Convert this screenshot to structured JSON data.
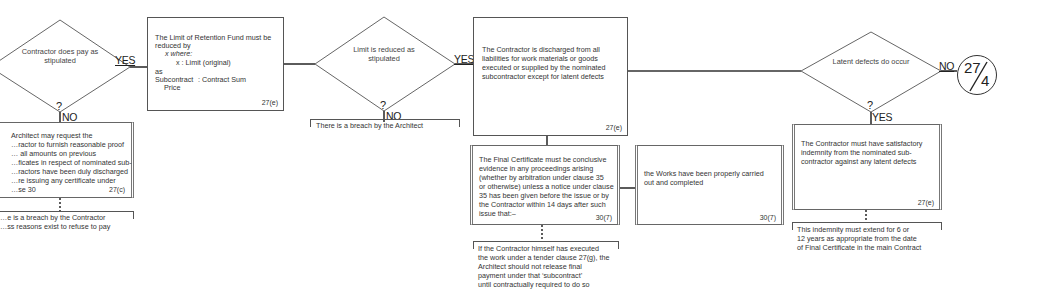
{
  "flowchart": {
    "decisions": [
      {
        "id": "d1",
        "text": "Contractor\ndoes pay as\nstipulated",
        "question_mark": "?",
        "yes_label": "YES",
        "no_label": "NO"
      },
      {
        "id": "d2",
        "text": "Limit\nis reduced\nas stipulated",
        "question_mark": "?",
        "yes_label": "YES",
        "no_label": "NO"
      },
      {
        "id": "d3",
        "text": "Latent\ndefects\ndo occur",
        "question_mark": "?",
        "yes_label": "YES",
        "no_label": "NO"
      }
    ],
    "boxes": {
      "architect_proof": {
        "text": "Architect may request the\n…ractor to furnish reasonable proof\n… all amounts on previous\n…ficates in respect of nominated sub-\n…ractors have been duly discharged\n…re issuing any certificate under\n…se 30",
        "ref": "27(c)"
      },
      "retention_fund": {
        "line1": "The Limit of Retention Fund must be",
        "line2": "reduced by",
        "line3": "x  where:",
        "line4": "x : Limit (original)",
        "line5": "as",
        "line6a": "Subcontract",
        "line6b": ":    Contract Sum",
        "line7": "Price",
        "ref": "27(e)"
      },
      "discharged": {
        "text": "The Contractor is discharged from all\nliabilities for work materials or goods\nexecuted or supplied by the nominated\nsubcontractor except for latent defects",
        "ref": "27(e)"
      },
      "final_certificate": {
        "text": "The Final Certificate must be conclusive\nevidence in any proceedings arising\n(whether by arbitration under clause 35\nor otherwise) unless a notice under clause\n35 has been given before the issue or by\nthe Contractor within 14 days after such\nissue that:–",
        "ref": "30(7)"
      },
      "works_completed": {
        "text": "the Works have been properly carried\nout and completed",
        "ref": "30(7)"
      },
      "indemnity": {
        "text": "The Contractor must have satisfactory\nindemnity from the nominated sub-\ncontractor against any latent defects",
        "ref": "27(e)"
      }
    },
    "notes": {
      "breach_contractor": "…e is a breach by the Contractor\n…ss reasons exist to refuse to pay",
      "breach_architect": "There is a breach by the Architect",
      "tender_clause": "If the Contractor himself has executed\nthe work under a tender clause 27(g), the\nArchitect should not release final\npayment under that ‘subcontract’\nuntil contractually required to do so",
      "indemnity_extent": "This indemnity must extend for 6 or\n12 years as appropriate from the date\nof Final Certificate in the main Contract"
    },
    "connector": {
      "top": "27",
      "bottom": "4"
    }
  }
}
